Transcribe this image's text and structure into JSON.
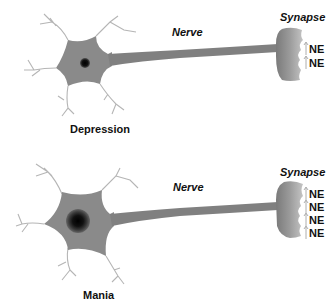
{
  "diagram": {
    "colors": {
      "cell_body": "#8a8a8a",
      "axon": "#7f7f7f",
      "nucleus": "#111111",
      "dendrite": "#bbbbbb",
      "synapse_light": "#b8b8b8",
      "synapse_dark": "#8c8c8c",
      "text": "#111111"
    },
    "panels": [
      {
        "state_label": "Depression",
        "nerve_label": "Nerve",
        "synapse_label": "Synapse",
        "nucleus_size": "small",
        "neurotransmitters": [
          "NE",
          "NE"
        ]
      },
      {
        "state_label": "Mania",
        "nerve_label": "Nerve",
        "synapse_label": "Synapse",
        "nucleus_size": "large",
        "neurotransmitters": [
          "NE",
          "NE",
          "NE",
          "NE"
        ]
      }
    ]
  }
}
